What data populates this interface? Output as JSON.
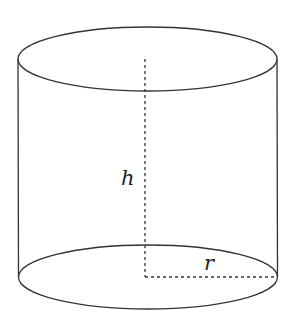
{
  "diagram": {
    "type": "cylinder",
    "colors": {
      "stroke": "#333333",
      "background": "#ffffff"
    },
    "labels": {
      "height": "h",
      "radius": "r"
    }
  }
}
